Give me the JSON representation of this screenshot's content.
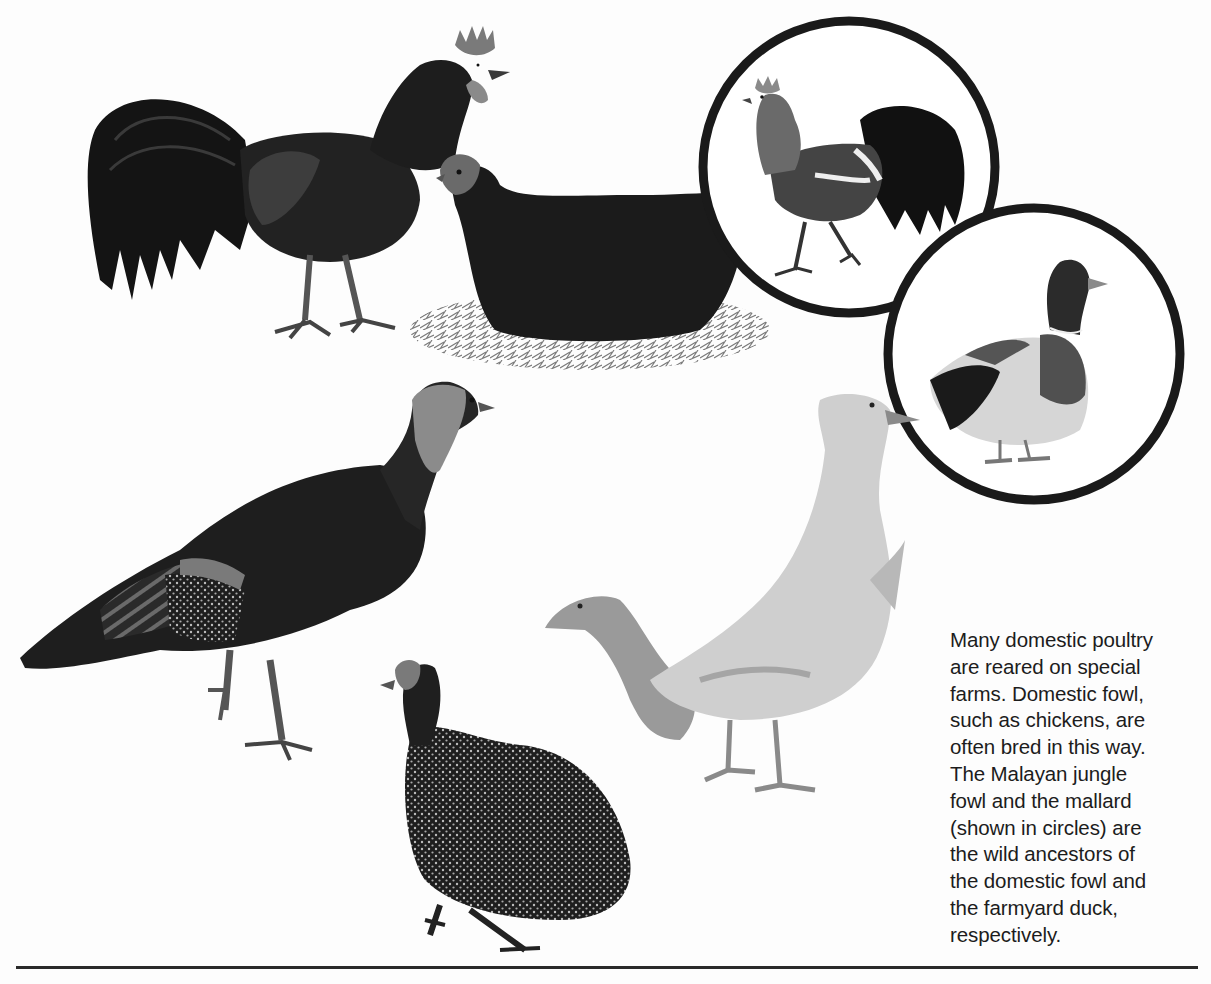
{
  "page": {
    "type": "book-page-illustration",
    "background": "#fdfdfd",
    "ink_color": "#1c1c1c"
  },
  "illustration": {
    "subjects": [
      {
        "id": "rooster",
        "label": "domestic cockerel",
        "position": "top-left"
      },
      {
        "id": "hen",
        "label": "domestic hen on nest",
        "position": "top-center"
      },
      {
        "id": "jungle-fowl",
        "label": "Malayan jungle fowl",
        "position": "top-right circle",
        "in_circle": true
      },
      {
        "id": "mallard",
        "label": "mallard drake",
        "position": "right circle",
        "in_circle": true
      },
      {
        "id": "turkey",
        "label": "turkey",
        "position": "middle-left"
      },
      {
        "id": "guinea-fowl",
        "label": "guinea fowl",
        "position": "bottom-center"
      },
      {
        "id": "domestic-ducks",
        "label": "farmyard ducks",
        "position": "center-right"
      }
    ],
    "circles": [
      {
        "id": "circle-jungle-fowl",
        "cx": 849,
        "cy": 167,
        "r": 146
      },
      {
        "id": "circle-mallard",
        "cx": 1034,
        "cy": 354,
        "r": 146
      }
    ]
  },
  "caption": {
    "lines": [
      "Many domestic poultry",
      "are reared on special",
      "farms. Domestic fowl,",
      "such as chickens, are",
      "often bred in this way.",
      "The Malayan jungle",
      "fowl and the mallard",
      "(shown in circles) are",
      "the wild ancestors of",
      "the domestic fowl and",
      "the farmyard duck,",
      "respectively."
    ]
  }
}
